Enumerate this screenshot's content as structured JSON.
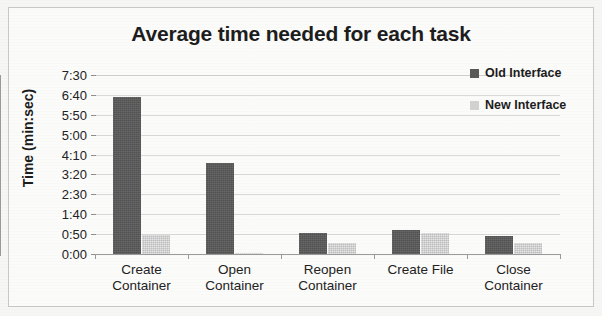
{
  "chart_data": {
    "type": "bar",
    "title": "Average time needed for each task",
    "xlabel": "",
    "ylabel": "Time (min:sec)",
    "categories": [
      "Create Container",
      "Open Container",
      "Reopen Container",
      "Create File",
      "Close Container"
    ],
    "category_lines": [
      [
        "Create",
        "Container"
      ],
      [
        "Open",
        "Container"
      ],
      [
        "Reopen",
        "Container"
      ],
      [
        "Create File",
        ""
      ],
      [
        "Close",
        "Container"
      ]
    ],
    "series": [
      {
        "name": "Old Interface",
        "color": "#595959",
        "values_seconds": [
          395,
          228,
          53,
          60,
          45
        ],
        "values_label": [
          "6:35",
          "3:48",
          "0:53",
          "1:00",
          "0:45"
        ]
      },
      {
        "name": "New Interface",
        "color": "#d2d2d2",
        "values_seconds": [
          48,
          3,
          28,
          53,
          28
        ],
        "values_label": [
          "0:48",
          "0:03",
          "0:28",
          "0:53",
          "0:28"
        ]
      }
    ],
    "ylim_seconds": [
      0,
      450
    ],
    "ytick_seconds": [
      0,
      50,
      100,
      150,
      200,
      250,
      300,
      350,
      400,
      450
    ],
    "ytick_labels": [
      "0:00",
      "0:50",
      "1:40",
      "2:30",
      "3:20",
      "4:10",
      "5:00",
      "5:50",
      "6:40",
      "7:30"
    ],
    "grid": true,
    "legend_position": "right"
  },
  "legend": {
    "items": [
      {
        "label": "Old Interface",
        "color": "#595959"
      },
      {
        "label": "New Interface",
        "color": "#d2d2d2"
      }
    ]
  }
}
